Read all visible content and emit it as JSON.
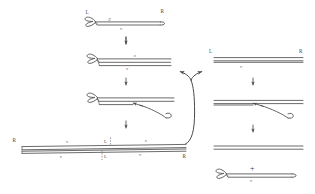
{
  "figure": {
    "type": "molecular-biology-schematic",
    "title": "",
    "background_color": "#ffffff",
    "line_color": "#5a5a5a",
    "label_color": "#555555"
  },
  "labels": {
    "L": "L",
    "R": "R",
    "v": "v",
    "c": "c",
    "three_prime": "3'",
    "plus": "+"
  },
  "left_pathway": {
    "step1": {
      "name": "hairpin-telomere-linear",
      "left_end_label": "L",
      "right_end_label": "R",
      "prime_label": "3'",
      "bottom_strand_label": "v"
    },
    "step2": {
      "name": "hairpin-partially-replicated",
      "top_strand_label": "c",
      "bottom_strand_label": "v"
    },
    "step3": {
      "name": "hairpin-strand-displacement",
      "arrow": "displacement-arrow-left"
    },
    "step4": {
      "name": "resolved-duplex-dimer",
      "left_end_label": "R",
      "right_end_label": "R",
      "top_left_label": "v",
      "top_right_label": "c",
      "bottom_left_label": "c",
      "bottom_right_label": "v",
      "center_top_label": "L",
      "center_bottom_label": "L"
    }
  },
  "right_pathway": {
    "step1": {
      "name": "linear-duplex",
      "left_end_label": "L",
      "right_end_label": "R",
      "bottom_strand_label": "v"
    },
    "step2": {
      "name": "duplex-strand-displacement",
      "arrow": "displacement-arrow-left"
    },
    "step3": {
      "name": "duplex-product",
      "plus": "+",
      "hairpin_label": "v"
    }
  },
  "arrows": {
    "down_arrow": "down-arrow",
    "branch_arrow": "branching-curved-arrow"
  }
}
